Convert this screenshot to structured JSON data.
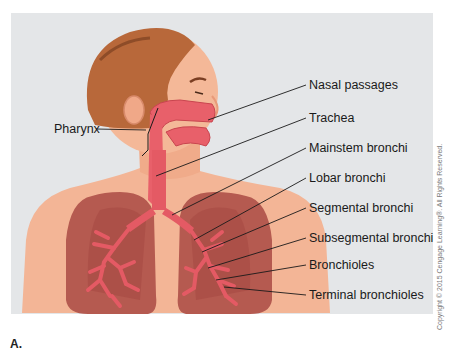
{
  "figure": {
    "letter": "A.",
    "copyright": "Copyright © 2015 Cengage Learning®. All Rights Reserved.",
    "colors": {
      "background_panel": "#e4e6e8",
      "skin": "#f4b898",
      "hair": "#b8683a",
      "lung": "#b8554c",
      "airway": "#e8606a",
      "leader_line": "#1a1a1a"
    }
  },
  "labels": {
    "left": [
      {
        "text": "Pharynx"
      }
    ],
    "right": [
      {
        "text": "Nasal passages"
      },
      {
        "text": "Trachea"
      },
      {
        "text": "Mainstem bronchi"
      },
      {
        "text": "Lobar bronchi"
      },
      {
        "text": "Segmental bronchi"
      },
      {
        "text": "Subsegmental bronchi"
      },
      {
        "text": "Bronchioles"
      },
      {
        "text": "Terminal bronchioles"
      }
    ]
  }
}
